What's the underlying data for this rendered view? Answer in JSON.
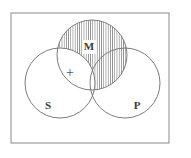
{
  "figure": {
    "type": "venn-diagram",
    "background_color": "#ffffff",
    "frame": {
      "name": "diagram-border",
      "x": 11,
      "y": 13,
      "width": 158,
      "height": 130,
      "stroke_color": "#8a8a8a",
      "stroke_width": 1
    },
    "circles": [
      {
        "id": "M",
        "label": "M",
        "cx": 92,
        "cy": 55,
        "r": 35,
        "label_x": 89,
        "label_y": 47,
        "stroke_color": "#6e6e6e"
      },
      {
        "id": "S",
        "label": "S",
        "cx": 60,
        "cy": 83,
        "r": 35,
        "label_x": 48,
        "label_y": 106,
        "stroke_color": "#6e6e6e"
      },
      {
        "id": "P",
        "label": "P",
        "cx": 125,
        "cy": 83,
        "r": 35,
        "label_x": 137,
        "label_y": 106,
        "stroke_color": "#6e6e6e"
      }
    ],
    "shading": {
      "name": "m-minus-s-shaded-region",
      "region": "M minus S",
      "pattern": "vertical-hatch",
      "line_color": "#6b6b6b",
      "line_spacing": 2.2,
      "line_width": 0.7
    },
    "marks": [
      {
        "id": "plus",
        "symbol": "+",
        "region": "S intersect M, outside P",
        "x": 70,
        "y": 74,
        "color": "#555555"
      }
    ],
    "labels": {
      "major_term": "P",
      "minor_term": "S",
      "middle_term": "M"
    }
  }
}
